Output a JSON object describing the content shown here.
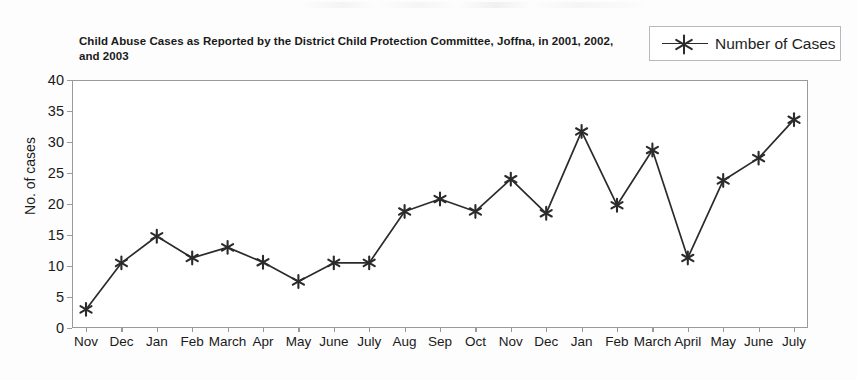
{
  "chart_data": {
    "type": "line",
    "title": "Child Abuse Cases as Reported by the District Child Protection Committee, Joffna, in 2001, 2002, and 2003",
    "xlabel": "",
    "ylabel": "No. of cases",
    "ylim": [
      0,
      40
    ],
    "yticks": [
      0,
      5,
      10,
      15,
      20,
      25,
      30,
      35,
      40
    ],
    "grid": false,
    "legend_position": "top-right",
    "marker": "six-pointed-asterisk",
    "line_color": "#2b2b2b",
    "categories": [
      "Nov",
      "Dec",
      "Jan",
      "Feb",
      "March",
      "Apr",
      "May",
      "June",
      "July",
      "Aug",
      "Sep",
      "Oct",
      "Nov",
      "Dec",
      "Jan",
      "Feb",
      "March",
      "April",
      "May",
      "June",
      "July"
    ],
    "series": [
      {
        "name": "Number of Cases",
        "values": [
          3,
          10.5,
          14.8,
          11.3,
          13,
          10.6,
          7.5,
          10.5,
          10.5,
          18.8,
          20.8,
          18.8,
          24,
          18.5,
          31.7,
          19.8,
          28.7,
          11.3,
          23.8,
          27.4,
          33.6
        ]
      }
    ]
  },
  "legend": {
    "label": "Number of Cases"
  },
  "axis": {
    "y_title": "No. of cases"
  }
}
